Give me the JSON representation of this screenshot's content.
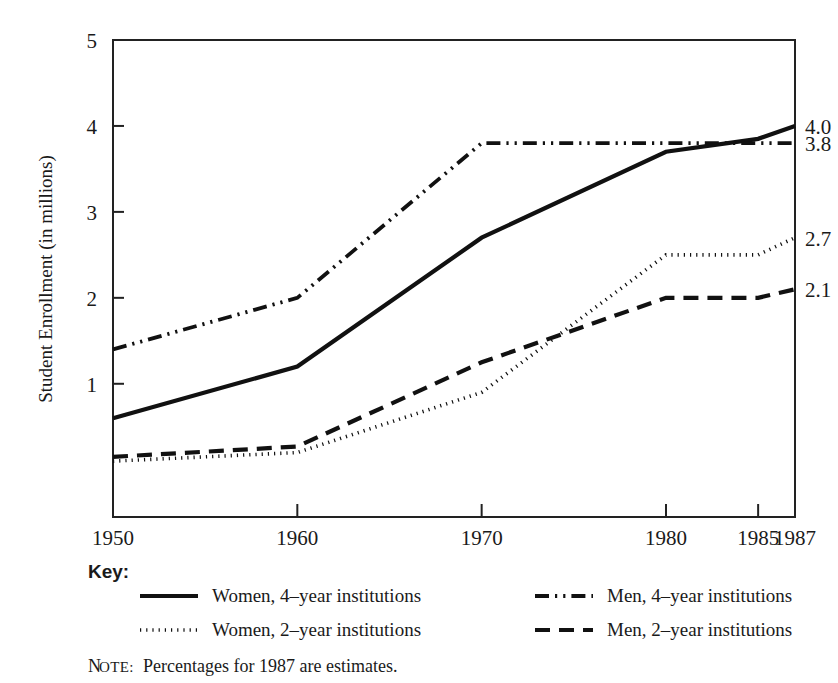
{
  "chart_data": {
    "type": "line",
    "title": "",
    "xlabel": "",
    "ylabel": "Student Enrollment (in millions)",
    "x": [
      1950,
      1960,
      1970,
      1980,
      1985,
      1987
    ],
    "xticks": [
      "1950",
      "1960",
      "1970",
      "1980",
      "1985",
      "1987"
    ],
    "yticks": [
      "1",
      "2",
      "3",
      "4",
      "5"
    ],
    "ylim": [
      -0.55,
      5.0
    ],
    "xlim": [
      1950,
      1987
    ],
    "grid": false,
    "legend_position": "below-axes",
    "series": [
      {
        "name": "Women, 4–year institutions",
        "style": "solid",
        "values": [
          0.6,
          1.2,
          2.7,
          3.7,
          3.85,
          4.0
        ],
        "end_label": "4.0"
      },
      {
        "name": "Women, 2–year institutions",
        "style": "dotted",
        "values": [
          0.1,
          0.2,
          0.9,
          2.5,
          2.5,
          2.7
        ],
        "end_label": "2.7"
      },
      {
        "name": "Men, 4–year institutions",
        "style": "dash-dot-dot",
        "values": [
          1.4,
          2.0,
          3.8,
          3.8,
          3.8,
          3.8
        ],
        "end_label": "3.8"
      },
      {
        "name": "Men, 2–year institutions",
        "style": "dashed",
        "values": [
          0.15,
          0.27,
          1.25,
          2.0,
          2.0,
          2.1
        ],
        "end_label": "2.1"
      }
    ]
  },
  "key": {
    "title": "Key:",
    "entries": [
      {
        "label": "Women, 4–year institutions",
        "style": "solid",
        "column": 0,
        "row": 0
      },
      {
        "label": "Women, 2–year institutions",
        "style": "dotted",
        "column": 0,
        "row": 1
      },
      {
        "label": "Men, 4–year institutions",
        "style": "dash-dot-dot",
        "column": 1,
        "row": 0
      },
      {
        "label": "Men, 2–year institutions",
        "style": "dashed",
        "column": 1,
        "row": 1
      }
    ]
  },
  "note": {
    "tag_first": "N",
    "tag_rest": "OTE:",
    "text": "Percentages for 1987 are estimates."
  },
  "colors": {
    "ink": "#1a1a1a",
    "line": "#111111",
    "frame": "#222222",
    "background": "#ffffff"
  }
}
